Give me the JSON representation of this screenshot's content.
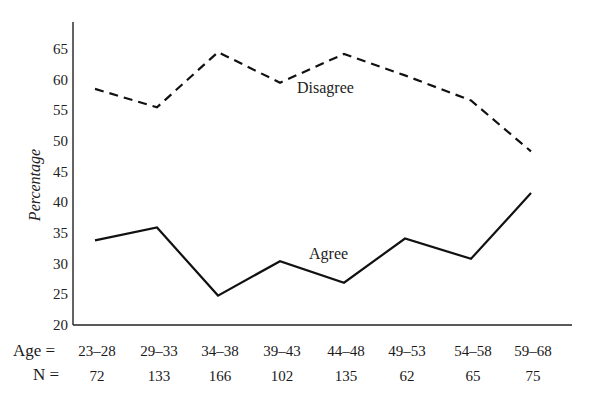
{
  "chart_data": {
    "type": "line",
    "title": "",
    "xlabel": "Age",
    "ylabel": "Percentage",
    "ylim": [
      20,
      65
    ],
    "yticks": [
      20,
      25,
      30,
      35,
      40,
      45,
      50,
      55,
      60,
      65
    ],
    "grid": false,
    "legend": "inline labels",
    "categories": [
      "23–28",
      "29–33",
      "34–38",
      "39–43",
      "44–48",
      "49–53",
      "54–58",
      "59–68"
    ],
    "n_values": [
      72,
      133,
      166,
      102,
      135,
      62,
      65,
      75
    ],
    "row_labels": {
      "age": "Age =",
      "n": "N ="
    },
    "series": [
      {
        "name": "Disagree",
        "style": "dashed",
        "values": [
          58.5,
          55.5,
          64.5,
          59.5,
          64.2,
          60.7,
          56.6,
          48.3
        ]
      },
      {
        "name": "Agree",
        "style": "solid",
        "values": [
          33.8,
          35.9,
          24.8,
          30.4,
          26.9,
          34.1,
          30.8,
          41.5
        ]
      }
    ],
    "annotations": [
      {
        "text": "Disagree",
        "near_category": "44–48"
      },
      {
        "text": "Agree",
        "near_category": "44–48"
      }
    ]
  },
  "colors": {
    "line": "#111111",
    "axis": "#222222",
    "background": "#ffffff"
  }
}
